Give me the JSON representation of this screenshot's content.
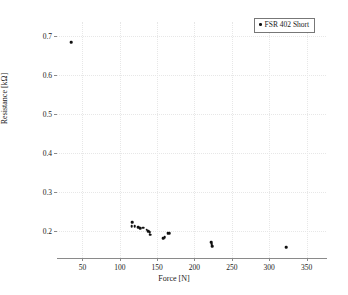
{
  "chart_data": {
    "type": "scatter",
    "title": "",
    "xlabel": "Force [N]",
    "ylabel": "Resistance [kΩ]",
    "xlim": [
      16,
      376
    ],
    "ylim": [
      0.13,
      0.735
    ],
    "xticks": [
      50,
      100,
      150,
      200,
      250,
      300,
      350
    ],
    "xticklabels": [
      "50",
      "100",
      "150",
      "200",
      "250",
      "300",
      "350"
    ],
    "yticks": [
      0.2,
      0.3,
      0.4,
      0.5,
      0.6,
      0.7
    ],
    "yticklabels": [
      "0.2",
      "0.3",
      "0.4",
      "0.5",
      "0.6",
      "0.7"
    ],
    "grid": true,
    "legend_position": "top-right",
    "series": [
      {
        "name": "FSR 402 Short",
        "marker": "dot",
        "color": "#111111",
        "points": [
          {
            "x": 35,
            "y": 0.683
          },
          {
            "x": 116,
            "y": 0.211
          },
          {
            "x": 117,
            "y": 0.222
          },
          {
            "x": 120,
            "y": 0.212
          },
          {
            "x": 125,
            "y": 0.209
          },
          {
            "x": 127,
            "y": 0.207
          },
          {
            "x": 131,
            "y": 0.208
          },
          {
            "x": 136,
            "y": 0.203
          },
          {
            "x": 138,
            "y": 0.199
          },
          {
            "x": 140,
            "y": 0.196
          },
          {
            "x": 141,
            "y": 0.19
          },
          {
            "x": 158,
            "y": 0.181
          },
          {
            "x": 160,
            "y": 0.183
          },
          {
            "x": 164,
            "y": 0.193
          },
          {
            "x": 166,
            "y": 0.194
          },
          {
            "x": 222,
            "y": 0.17
          },
          {
            "x": 223,
            "y": 0.165
          },
          {
            "x": 224,
            "y": 0.161
          },
          {
            "x": 323,
            "y": 0.158
          }
        ]
      }
    ]
  },
  "legend": {
    "entries": [
      {
        "label": "FSR 402 Short"
      }
    ]
  }
}
